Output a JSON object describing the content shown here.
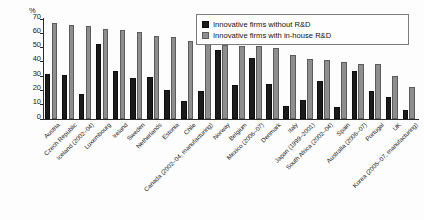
{
  "chart_data": {
    "type": "bar",
    "title": "",
    "subtitle": "",
    "xlabel": "",
    "ylabel": "%",
    "ylim": [
      0,
      70
    ],
    "ytick_step": 10,
    "yticks": [
      0,
      10,
      20,
      30,
      40,
      50,
      60,
      70
    ],
    "grid": false,
    "legend_position": "top-right",
    "orientation": "vertical",
    "categories": [
      "Austria",
      "Czech Republic",
      "Iceland (2002–04)",
      "Luxembourg",
      "Ireland",
      "Sweden",
      "Netherlands",
      "Estonia",
      "Chile",
      "Canada (2002–04, manufacturing)",
      "Norway",
      "Belgium",
      "Mexico (2006–07)",
      "Denmark",
      "Italy",
      "Japan (1999–2001)",
      "South Africa (2002–04)",
      "Spain",
      "Australia (2006–07)",
      "Portugal",
      "UK",
      "Korea (2005–07, manufacturing)"
    ],
    "series": [
      {
        "name": "Innovative firms without R&D",
        "color": "#1b1b1b",
        "values": [
          31,
          30.5,
          17,
          52,
          33,
          28.5,
          29,
          20,
          12,
          19.5,
          48,
          23.5,
          42.5,
          24.5,
          9,
          13,
          26,
          8,
          33,
          19.5,
          15,
          6
        ]
      },
      {
        "name": "Innovative firms with in-house R&D",
        "color": "#8e8e8e",
        "values": [
          67,
          65.5,
          65,
          62.5,
          62,
          60.5,
          57.5,
          57,
          54,
          52.5,
          51.5,
          51,
          50.5,
          49.5,
          44.5,
          42,
          41,
          39.5,
          38.5,
          38,
          29.5,
          22
        ]
      }
    ]
  },
  "legend": {
    "items": [
      {
        "label": "Innovative firms without R&D",
        "swatch": "black-square-icon"
      },
      {
        "label": "Innovative firms with in-house R&D",
        "swatch": "gray-square-icon"
      }
    ]
  },
  "axis": {
    "y_unit": "%"
  }
}
